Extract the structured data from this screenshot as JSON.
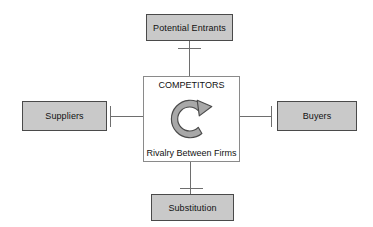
{
  "diagram": {
    "canvas": {
      "width": 373,
      "height": 227,
      "background": "#ffffff"
    },
    "center": {
      "title": "COMPETITORS",
      "subtitle": "Rivalry Between Firms",
      "icon": "circular-clockwise-arrow-icon",
      "fill": "#ffffff",
      "border": "#8a8a8a"
    },
    "forces": [
      {
        "id": "potential-entrants",
        "label": "Potential Entrants",
        "position": "top",
        "fill": "#c9c9c9",
        "border": "#4a4a4a"
      },
      {
        "id": "suppliers",
        "label": "Suppliers",
        "position": "left",
        "fill": "#c9c9c9",
        "border": "#4a4a4a"
      },
      {
        "id": "buyers",
        "label": "Buyers",
        "position": "right",
        "fill": "#c9c9c9",
        "border": "#4a4a4a"
      },
      {
        "id": "substitution",
        "label": "Substitution",
        "position": "bottom",
        "fill": "#c9c9c9",
        "border": "#4a4a4a"
      }
    ],
    "connectors": {
      "color": "#6e6e6e",
      "style": "line-with-t-terminator"
    }
  }
}
